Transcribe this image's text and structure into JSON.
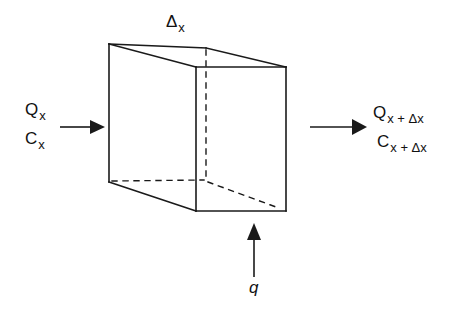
{
  "diagram": {
    "title_label": {
      "symbol": "Δ",
      "subscript": "x"
    },
    "inflow": {
      "flow_label": {
        "main": "Q",
        "subscript": "x"
      },
      "conc_label": {
        "main": "C",
        "subscript": "x"
      }
    },
    "outflow": {
      "flow_label": {
        "main": "Q",
        "subscript": "x + Δx"
      },
      "conc_label": {
        "main": "C",
        "subscript": "x + Δx"
      }
    },
    "lateral_inflow": {
      "label": "q"
    },
    "colors": {
      "stroke": "#1a1a1a",
      "background": "#ffffff"
    }
  }
}
